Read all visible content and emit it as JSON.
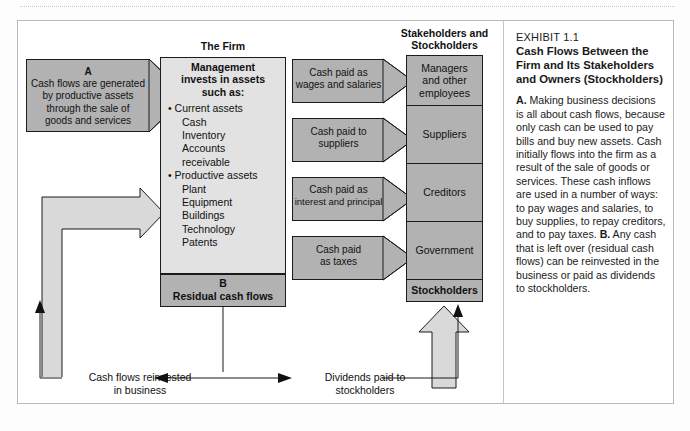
{
  "exhibit": {
    "number": "EXHIBIT 1.1",
    "title_lines": [
      "Cash Flows Between the",
      "Firm and Its Stakeholders",
      "and Owners (Stockholders)"
    ],
    "body_a_prefix": "A.",
    "body_a": " Making business decisions is all about cash flows, because only cash can be used to pay bills and buy new assets. Cash initially flows into the firm as a result of the sale of goods or services. These cash inflows are used in a number of ways: to pay wages and salaries, to buy supplies, to repay creditors, and to pay taxes. ",
    "body_b_prefix": "B.",
    "body_b": " Any cash that is left over (residual cash flows) can be reinvested in the business or paid as dividends to stockholders."
  },
  "headers": {
    "firm": "The Firm",
    "stakeholders_line1": "Stakeholders and",
    "stakeholders_line2": "Stockholders"
  },
  "inflow_arrow": {
    "label": "A",
    "lines": [
      "Cash flows are generated",
      "by productive assets",
      "through the sale of",
      "goods and services"
    ]
  },
  "firm_box": {
    "heading_lines": [
      "Management",
      "invests in assets",
      "such as:"
    ],
    "items": [
      {
        "text": "• Current assets",
        "level": "b"
      },
      {
        "text": "Cash",
        "level": "s"
      },
      {
        "text": "Inventory",
        "level": "s"
      },
      {
        "text": "Accounts",
        "level": "s"
      },
      {
        "text": "receivable",
        "level": "s"
      },
      {
        "text": "• Productive assets",
        "level": "b"
      },
      {
        "text": "Plant",
        "level": "s"
      },
      {
        "text": "Equipment",
        "level": "s"
      },
      {
        "text": "Buildings",
        "level": "s"
      },
      {
        "text": "Technology",
        "level": "s"
      },
      {
        "text": "Patents",
        "level": "s"
      }
    ]
  },
  "residual_box": {
    "label": "B",
    "text": "Residual cash flows"
  },
  "payment_arrows": [
    {
      "lines": [
        "Cash paid as",
        "wages and salaries"
      ],
      "top": 59
    },
    {
      "lines": [
        "Cash paid to",
        "suppliers"
      ],
      "top": 118
    },
    {
      "lines": [
        "Cash paid as",
        "interest and principal"
      ],
      "top": 177
    },
    {
      "lines": [
        "Cash paid",
        "as taxes"
      ],
      "top": 236
    }
  ],
  "stakeholders": [
    {
      "lines": [
        "Managers",
        "and other",
        "employees"
      ],
      "height": 51,
      "bold": false
    },
    {
      "lines": [
        "Suppliers"
      ],
      "height": 59,
      "bold": false
    },
    {
      "lines": [
        "Creditors"
      ],
      "height": 59,
      "bold": false
    },
    {
      "lines": [
        "Government"
      ],
      "height": 59,
      "bold": false
    },
    {
      "lines": [
        "Stockholders"
      ],
      "height": 23,
      "bold": true
    }
  ],
  "bottom_flows": {
    "left_lines": [
      "Cash flows reinvested",
      "in business"
    ],
    "right_lines": [
      "Dividends paid to",
      "stockholders"
    ]
  },
  "colors": {
    "gray_dark": "#b2b2b2",
    "gray_light": "#e2e2e2",
    "outline": "#1b1b1b",
    "card_border": "#b9b9b9"
  }
}
